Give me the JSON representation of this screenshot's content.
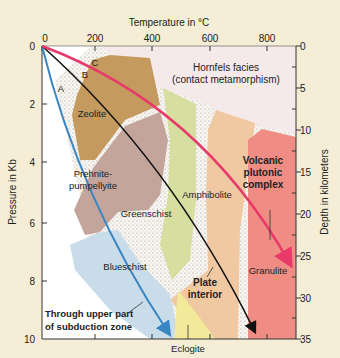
{
  "axes": {
    "top": {
      "label": "Temperature in °C",
      "ticks": [
        "0",
        "200",
        "400",
        "600",
        "800"
      ]
    },
    "left": {
      "label": "Pressure in Kb",
      "ticks": [
        "0",
        "2",
        "4",
        "6",
        "8",
        "10"
      ]
    },
    "right": {
      "label": "Depth in kilometers",
      "ticks": [
        "0",
        "5",
        "10",
        "15",
        "20",
        "25",
        "30",
        "35"
      ]
    }
  },
  "facies": {
    "hornfels_line1": "Hornfels facies",
    "hornfels_line2": "(contact metamorphism)",
    "zeolite": "Zeolite",
    "prehnite_line1": "Prehnite-",
    "prehnite_line2": "pumpellyite",
    "greenschist": "Greenschist",
    "amphibolite": "Amphibolite",
    "blueschist": "Blueschist",
    "granulite": "Granulite",
    "eclogite": "Eclogite"
  },
  "paths": {
    "a": "A",
    "b": "B",
    "c": "C",
    "subduction_line1": "Through upper part",
    "subduction_line2": "of subduction zone",
    "plate_line1": "Plate",
    "plate_line2": "interior",
    "volcanic_line1": "Volcanic",
    "volcanic_line2": "plutonic",
    "volcanic_line3": "complex"
  },
  "colors": {
    "background": "#f5edd6",
    "hornfels": "#f6e9ea",
    "zeolite": "#c49a5e",
    "prehnite": "#c4a59c",
    "greenschist": "#d6dea0",
    "amphibolite": "#f0c9a2",
    "blueschist": "#c9dcea",
    "granulite": "#ef8d84",
    "eclogite": "#f2ea9a",
    "path_a": "#3a86c4",
    "path_b": "#111111",
    "path_c": "#e83a6a"
  }
}
